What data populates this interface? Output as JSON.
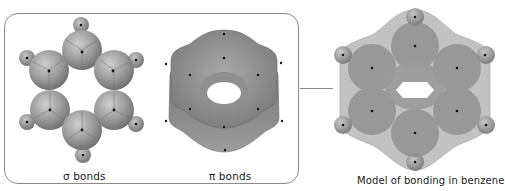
{
  "figure": {
    "panels": [
      {
        "id": "sigma",
        "label": "σ bonds"
      },
      {
        "id": "pi",
        "label": "π bonds"
      },
      {
        "id": "model",
        "label": "Model of bonding in benzene"
      }
    ]
  },
  "colors": {
    "frame": "#8a8a8a",
    "sphere_light": "#c4c4c4",
    "sphere_mid": "#8e8e8e",
    "sphere_dark": "#5e5e5e",
    "nucleus": "#111111",
    "background": "#ffffff"
  }
}
